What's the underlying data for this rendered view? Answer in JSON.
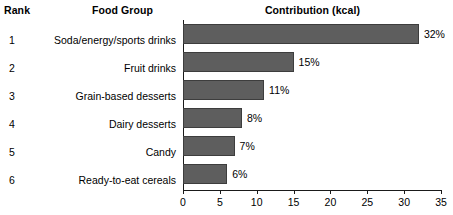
{
  "header": {
    "rank": "Rank",
    "food_group": "Food Group",
    "contribution": "Contribution (kcal)"
  },
  "colors": {
    "bar_fill": "#5e5e5e",
    "bar_stroke": "#3d3d3d",
    "axis": "#1a1a1a",
    "background": "#ffffff",
    "text": "#000000"
  },
  "rows": [
    {
      "rank": "1",
      "food_group": "Soda/energy/sports drinks",
      "value": 32,
      "label": "32%"
    },
    {
      "rank": "2",
      "food_group": "Fruit drinks",
      "value": 15,
      "label": "15%"
    },
    {
      "rank": "3",
      "food_group": "Grain-based desserts",
      "value": 11,
      "label": "11%"
    },
    {
      "rank": "4",
      "food_group": "Dairy desserts",
      "value": 8,
      "label": "8%"
    },
    {
      "rank": "5",
      "food_group": "Candy",
      "value": 7,
      "label": "7%"
    },
    {
      "rank": "6",
      "food_group": "Ready-to-eat cereals",
      "value": 6,
      "label": "6%"
    }
  ],
  "axis": {
    "ticks": [
      0,
      5,
      10,
      15,
      20,
      25,
      30,
      35
    ],
    "tick_labels": [
      "0",
      "5",
      "10",
      "15",
      "20",
      "25",
      "30",
      "35"
    ],
    "min": 0,
    "max": 35
  },
  "chart_data": {
    "type": "bar",
    "orientation": "horizontal",
    "title": "Contribution (kcal)",
    "xlabel": "",
    "ylabel": "",
    "categories": [
      "Soda/energy/sports drinks",
      "Fruit drinks",
      "Grain-based desserts",
      "Dairy desserts",
      "Candy",
      "Ready-to-eat cereals"
    ],
    "values": [
      32,
      15,
      11,
      8,
      7,
      6
    ],
    "data_labels": [
      "32%",
      "15%",
      "11%",
      "8%",
      "7%",
      "6%"
    ],
    "ranks": [
      1,
      2,
      3,
      4,
      5,
      6
    ],
    "xlim": [
      0,
      35
    ],
    "xticks": [
      0,
      5,
      10,
      15,
      20,
      25,
      30,
      35
    ],
    "grid": false,
    "legend": false,
    "units": "percent of total kcal"
  }
}
